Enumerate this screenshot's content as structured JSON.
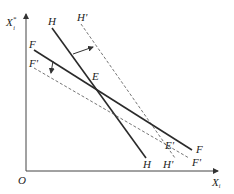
{
  "diagram": {
    "axes": {
      "y_label": "X",
      "y_label_sup": "*",
      "y_label_sub": "i",
      "x_label": "X",
      "x_label_sub": "i",
      "origin": "O"
    },
    "lines": [
      {
        "name": "H",
        "style": "solid",
        "label_start": "H",
        "label_end": "H"
      },
      {
        "name": "H'",
        "style": "dashed",
        "label_start": "H'",
        "label_end": "H'"
      },
      {
        "name": "F",
        "style": "solid",
        "label_start": "F",
        "label_end": "F"
      },
      {
        "name": "F'",
        "style": "dashed",
        "label_start": "F'",
        "label_end": "F'"
      }
    ],
    "points": {
      "E": "E",
      "E_prime": "E'"
    },
    "shifts": [
      {
        "from": "H",
        "to": "H'",
        "direction": "right"
      },
      {
        "from": "F",
        "to": "F'",
        "direction": "down"
      }
    ],
    "colors": {
      "solid": "#2a2a2a",
      "dashed": "#666666",
      "axis": "#444444"
    }
  }
}
